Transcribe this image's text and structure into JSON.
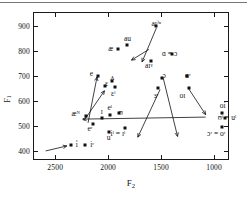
{
  "chart_data": {
    "type": "scatter",
    "title": "",
    "xlabel": "F2",
    "ylabel": "F1",
    "xlim": [
      2700,
      850
    ],
    "ylim": [
      950,
      360
    ],
    "x_ticks": [
      2500,
      2000,
      1500,
      1000
    ],
    "y_ticks": [
      400,
      500,
      600,
      700,
      800,
      900
    ],
    "x_reversed": true,
    "y_reversed": true,
    "grid": false,
    "legend": "none",
    "points": [
      {
        "label": "i̇",
        "x": 2355,
        "y": 422,
        "lx": 2305,
        "ly": 422,
        "anchor": "l"
      },
      {
        "label": "iʳ",
        "x": 2215,
        "y": 422,
        "lx": 2170,
        "ly": 422,
        "anchor": "l"
      },
      {
        "label": "u",
        "x": 1995,
        "y": 477,
        "lx": 1995,
        "ly": 452,
        "anchor": "c"
      },
      {
        "label": "iˡ = ɪˡ",
        "x": 1838,
        "y": 492,
        "lx": 1908,
        "ly": 468,
        "anchor": "c"
      },
      {
        "label": "ɔʳ = oʳ",
        "x": 928,
        "y": 497,
        "lx": 980,
        "ly": 468,
        "anchor": "c"
      },
      {
        "label": "eʳ",
        "x": 2140,
        "y": 509,
        "lx": 2172,
        "ly": 489,
        "anchor": "c"
      },
      {
        "label": "ʊˡ = uˡ",
        "x": 900,
        "y": 532,
        "lx": 965,
        "ly": 532,
        "anchor": "l"
      },
      {
        "label": "æᴺ",
        "x": 2210,
        "y": 541,
        "lx": 2265,
        "ly": 548,
        "anchor": "r"
      },
      {
        "label": "ɪ",
        "x": 2060,
        "y": 530,
        "lx": 2060,
        "ly": 556,
        "anchor": "c"
      },
      {
        "label": "oi",
        "x": 930,
        "y": 552,
        "lx": 918,
        "ly": 578,
        "anchor": "c"
      },
      {
        "label": "eˡ",
        "x": 1985,
        "y": 545,
        "lx": 1985,
        "ly": 573,
        "anchor": "c"
      },
      {
        "label": "ʊ",
        "x": 1900,
        "y": 552,
        "lx": 1900,
        "ly": 552,
        "anchor": "l"
      },
      {
        "label": "ɛˡ",
        "x": 1940,
        "y": 655,
        "lx": 1952,
        "ly": 628,
        "anchor": "c"
      },
      {
        "label": "oɪ",
        "x": 1240,
        "y": 652,
        "lx": 1300,
        "ly": 618,
        "anchor": "c"
      },
      {
        "label": "ɜʳ",
        "x": 1530,
        "y": 650,
        "lx": 1548,
        "ly": 620,
        "anchor": "c"
      },
      {
        "label": "ɛ",
        "x": 2030,
        "y": 660,
        "lx": 2000,
        "ly": 668,
        "anchor": "r"
      },
      {
        "label": "ʌ",
        "x": 1965,
        "y": 680,
        "lx": 1942,
        "ly": 690,
        "anchor": "r"
      },
      {
        "label": "e",
        "x": 2100,
        "y": 700,
        "lx": 2142,
        "ly": 708,
        "anchor": "r"
      },
      {
        "label": "ɔ",
        "x": 1490,
        "y": 690,
        "lx": 1455,
        "ly": 700,
        "anchor": "r"
      },
      {
        "label": "ɑʳ",
        "x": 1260,
        "y": 697,
        "lx": 1222,
        "ly": 699,
        "anchor": "r"
      },
      {
        "label": "aɪˠ",
        "x": 1600,
        "y": 757,
        "lx": 1580,
        "ly": 740,
        "anchor": "r"
      },
      {
        "label": "ɑ = ɔ",
        "x": 1395,
        "y": 787,
        "lx": 1348,
        "ly": 788,
        "anchor": "r"
      },
      {
        "label": "æ",
        "x": 1910,
        "y": 805,
        "lx": 1952,
        "ly": 806,
        "anchor": "r"
      },
      {
        "label": "au",
        "x": 1820,
        "y": 822,
        "lx": 1818,
        "ly": 848,
        "anchor": "c"
      },
      {
        "label": "aɪˀⁿ",
        "x": 1548,
        "y": 900,
        "lx": 1500,
        "ly": 908,
        "anchor": "r"
      }
    ],
    "arrows": [
      {
        "x1": 2590,
        "y1": 400,
        "x2": 2390,
        "y2": 420
      },
      {
        "x1": 2230,
        "y1": 520,
        "x2": 2035,
        "y2": 640
      },
      {
        "x1": 2190,
        "y1": 512,
        "x2": 2105,
        "y2": 695
      },
      {
        "x1": 1080,
        "y1": 535,
        "x2": 2240,
        "y2": 527
      },
      {
        "x1": 1510,
        "y1": 645,
        "x2": 1720,
        "y2": 455
      },
      {
        "x1": 1480,
        "y1": 690,
        "x2": 1345,
        "y2": 458
      },
      {
        "x1": 1240,
        "y1": 648,
        "x2": 1080,
        "y2": 545
      },
      {
        "x1": 1545,
        "y1": 890,
        "x2": 1680,
        "y2": 755
      },
      {
        "x1": 1615,
        "y1": 805,
        "x2": 1780,
        "y2": 762
      }
    ]
  },
  "axes": {
    "y_label": "F",
    "y_label_sub": "1",
    "x_label": "F",
    "x_label_sub": "2"
  }
}
